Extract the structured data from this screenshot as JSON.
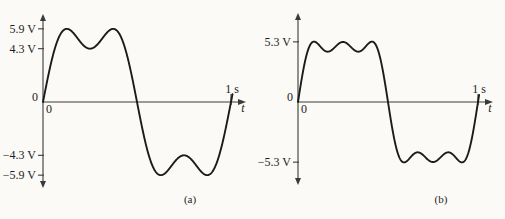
{
  "figure": {
    "background_color": "#fbfaf6",
    "ink_color": "#1b1b1b",
    "axis_color": "#3a3a3a"
  },
  "chart_data": [
    {
      "panel": "a",
      "type": "line",
      "caption": "(a)",
      "xlabel": "t",
      "x_unit": "s",
      "x_origin_label": "0",
      "y_origin_label": "0",
      "x_ticks": [
        {
          "value": 1,
          "label": "1 s"
        }
      ],
      "y_ticks": [
        {
          "value": 5.9,
          "label": "5.9 V"
        },
        {
          "value": 4.3,
          "label": "4.3 V"
        },
        {
          "value": -4.3,
          "label": "−4.3 V"
        },
        {
          "value": -5.9,
          "label": "−5.9 V"
        }
      ],
      "xlim": [
        0,
        1
      ],
      "ylim": [
        -7,
        7
      ],
      "grid": false,
      "series": [
        {
          "name": "fundamental plus 3rd harmonic",
          "period_s": 1,
          "harmonics": [
            {
              "n": 1,
              "amplitude_v": 6.32
            },
            {
              "n": 3,
              "amplitude_v": 2.02
            }
          ],
          "peak_v": 5.9,
          "ripple_dip_v": 4.3,
          "key_points": [
            [
              0,
              0
            ],
            [
              0.127,
              5.9
            ],
            [
              0.25,
              4.3
            ],
            [
              0.373,
              5.9
            ],
            [
              0.5,
              0
            ],
            [
              0.627,
              -5.9
            ],
            [
              0.75,
              -4.3
            ],
            [
              0.873,
              -5.9
            ],
            [
              1,
              0
            ]
          ]
        }
      ]
    },
    {
      "panel": "b",
      "type": "line",
      "caption": "(b)",
      "xlabel": "t",
      "x_unit": "s",
      "x_origin_label": "0",
      "y_origin_label": "0",
      "x_ticks": [
        {
          "value": 1,
          "label": "1 s"
        }
      ],
      "y_ticks": [
        {
          "value": 5.3,
          "label": "5.3 V"
        },
        {
          "value": -5.3,
          "label": "−5.3 V"
        }
      ],
      "xlim": [
        0,
        1
      ],
      "ylim": [
        -7,
        7
      ],
      "grid": false,
      "series": [
        {
          "name": "fundamental plus 3rd and 5th harmonics",
          "period_s": 1,
          "harmonics": [
            {
              "n": 1,
              "amplitude_v": 6.09
            },
            {
              "n": 3,
              "amplitude_v": 1.77
            },
            {
              "n": 5,
              "amplitude_v": 0.97
            }
          ],
          "peak_v": 5.3,
          "ripple_dip_v": 4.4,
          "key_points": [
            [
              0,
              0
            ],
            [
              0.083,
              5.3
            ],
            [
              0.167,
              4.4
            ],
            [
              0.25,
              5.3
            ],
            [
              0.333,
              4.4
            ],
            [
              0.417,
              5.3
            ],
            [
              0.5,
              0
            ],
            [
              0.583,
              -5.3
            ],
            [
              0.667,
              -4.4
            ],
            [
              0.75,
              -5.3
            ],
            [
              0.833,
              -4.4
            ],
            [
              0.917,
              -5.3
            ],
            [
              1,
              0
            ]
          ]
        }
      ]
    }
  ]
}
